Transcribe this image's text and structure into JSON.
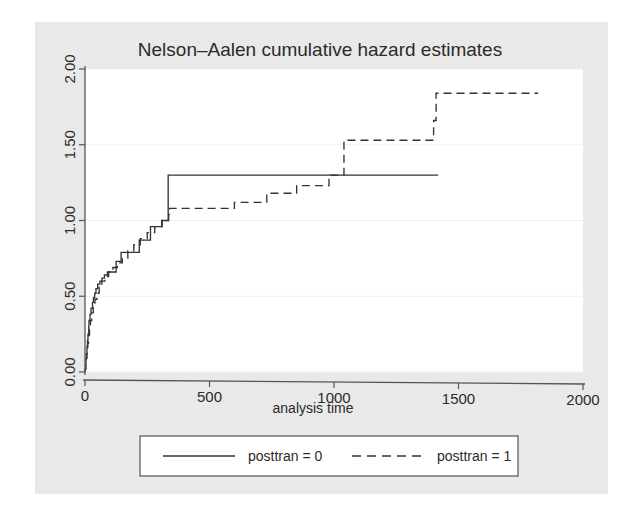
{
  "figure": {
    "background_color": "#e9e9e9",
    "plot_background_color": "#ffffff",
    "outer_background_color": "#ffffff",
    "line_color": "#333333",
    "grid_color": "#f0f0f0",
    "axis_color": "#555555"
  },
  "chart_data": {
    "type": "line",
    "title": "Nelson–Aalen cumulative hazard estimates",
    "xlabel": "analysis time",
    "ylabel": "",
    "xlim": [
      0,
      2000
    ],
    "ylim": [
      0,
      2.0
    ],
    "xticks": [
      0,
      500,
      1000,
      1500,
      2000
    ],
    "xtick_labels": [
      "0",
      "500",
      "1000",
      "1500",
      "2000"
    ],
    "yticks": [
      0.0,
      0.5,
      1.0,
      1.5,
      2.0
    ],
    "ytick_labels": [
      "0.00",
      "0.50",
      "1.00",
      "1.50",
      "2.00"
    ],
    "grid": true,
    "grid_axis": "y",
    "legend_position": "below",
    "step_style": "post",
    "series": [
      {
        "name": "posttran = 0",
        "style": "solid",
        "x": [
          1,
          3,
          4,
          5,
          8,
          10,
          12,
          15,
          16,
          20,
          24,
          30,
          34,
          39,
          44,
          51,
          60,
          68,
          78,
          90,
          110,
          125,
          145,
          165,
          186,
          207,
          218,
          240,
          263,
          285,
          308,
          334,
          340,
          1418
        ],
        "y": [
          0.02,
          0.05,
          0.08,
          0.12,
          0.17,
          0.21,
          0.25,
          0.3,
          0.34,
          0.38,
          0.42,
          0.46,
          0.49,
          0.52,
          0.55,
          0.58,
          0.6,
          0.62,
          0.64,
          0.66,
          0.66,
          0.73,
          0.79,
          0.79,
          0.79,
          0.79,
          0.87,
          0.87,
          0.96,
          0.96,
          1.0,
          1.3,
          1.3,
          1.3
        ]
      },
      {
        "name": "posttran = 1",
        "style": "dashed",
        "x": [
          1,
          3,
          5,
          8,
          11,
          14,
          18,
          22,
          27,
          33,
          40,
          48,
          57,
          68,
          80,
          95,
          112,
          130,
          150,
          172,
          196,
          222,
          250,
          280,
          310,
          336,
          340,
          583,
          600,
          680,
          730,
          800,
          850,
          900,
          980,
          1010,
          1040,
          1400,
          1410,
          1820
        ],
        "y": [
          0.02,
          0.05,
          0.09,
          0.14,
          0.19,
          0.24,
          0.29,
          0.34,
          0.39,
          0.44,
          0.48,
          0.52,
          0.56,
          0.6,
          0.63,
          0.66,
          0.69,
          0.72,
          0.75,
          0.8,
          0.84,
          0.88,
          0.92,
          0.96,
          1.0,
          1.04,
          1.08,
          1.08,
          1.12,
          1.12,
          1.18,
          1.18,
          1.23,
          1.23,
          1.3,
          1.3,
          1.53,
          1.66,
          1.84,
          1.84
        ]
      }
    ]
  },
  "legend": {
    "items": [
      {
        "label": "posttran = 0",
        "style": "solid"
      },
      {
        "label": "posttran = 1",
        "style": "dashed"
      }
    ]
  }
}
